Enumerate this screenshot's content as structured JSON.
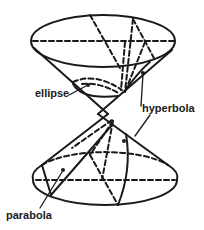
{
  "diagram": {
    "type": "double cone conic sections",
    "labels": {
      "ellipse": "ellipse",
      "hyperbola": "hyperbola",
      "parabola": "parabola"
    },
    "colors": {
      "line": "#1a1a1a",
      "background": "#ffffff"
    }
  }
}
